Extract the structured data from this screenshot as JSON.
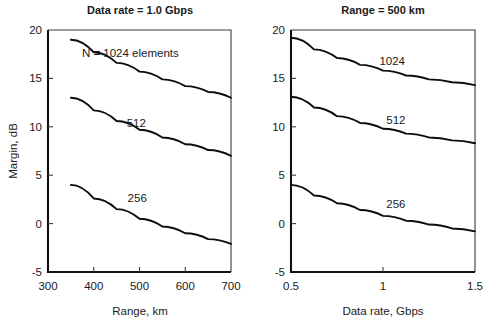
{
  "figure": {
    "width": 501,
    "height": 328,
    "background": "#ffffff",
    "ink_color": "#111111"
  },
  "chart_data": [
    {
      "type": "line",
      "panel": "left",
      "title": "Data rate = 1.0 Gbps",
      "xlabel": "Range, km",
      "ylabel": "Margin, dB",
      "xlim": [
        300,
        700
      ],
      "ylim": [
        -5,
        20
      ],
      "xticks": [
        300,
        400,
        500,
        600,
        700
      ],
      "xtick_labels": [
        "300",
        "400",
        "500",
        "600",
        "700"
      ],
      "yticks": [
        -5,
        0,
        5,
        10,
        15,
        20
      ],
      "ytick_labels": [
        "-5",
        "0",
        "5",
        "10",
        "15",
        "20"
      ],
      "grid": false,
      "legend_position": "inline-annotation",
      "series": [
        {
          "name": "N = 1024 elements",
          "label": "N = 1024 elements",
          "label_x": 480,
          "label_y": 17.6,
          "x": [
            350,
            400,
            450,
            500,
            550,
            600,
            650,
            700
          ],
          "values": [
            19.0,
            17.7,
            16.6,
            15.7,
            14.9,
            14.2,
            13.6,
            13.0
          ]
        },
        {
          "name": "512",
          "label": "512",
          "label_x": 493,
          "label_y": 10.4,
          "x": [
            350,
            400,
            450,
            500,
            550,
            600,
            650,
            700
          ],
          "values": [
            13.0,
            11.7,
            10.6,
            9.7,
            8.9,
            8.2,
            7.6,
            7.0
          ]
        },
        {
          "name": "256",
          "label": "256",
          "label_x": 495,
          "label_y": 2.6,
          "x": [
            350,
            400,
            450,
            500,
            550,
            600,
            650,
            700
          ],
          "values": [
            4.0,
            2.6,
            1.5,
            0.5,
            -0.3,
            -1.0,
            -1.6,
            -2.1
          ]
        }
      ]
    },
    {
      "type": "line",
      "panel": "right",
      "title": "Range = 500 km",
      "xlabel": "Data rate, Gbps",
      "ylabel": "Margin, dB",
      "xlim": [
        0.5,
        1.5
      ],
      "ylim": [
        -5,
        20
      ],
      "xticks": [
        0.5,
        1.0,
        1.5
      ],
      "xtick_labels": [
        "0.5",
        "1",
        "1.5"
      ],
      "yticks": [
        -5,
        0,
        5,
        10,
        15,
        20
      ],
      "ytick_labels": [
        "-5",
        "0",
        "5",
        "10",
        "15",
        "20"
      ],
      "grid": false,
      "legend_position": "inline-annotation",
      "series": [
        {
          "name": "1024",
          "label": "1024",
          "label_x": 1.05,
          "label_y": 16.8,
          "x": [
            0.5,
            0.625,
            0.75,
            0.875,
            1.0,
            1.125,
            1.25,
            1.375,
            1.5
          ],
          "values": [
            19.2,
            18.0,
            17.1,
            16.4,
            15.8,
            15.3,
            14.9,
            14.6,
            14.3
          ]
        },
        {
          "name": "512",
          "label": "512",
          "label_x": 1.07,
          "label_y": 10.7,
          "x": [
            0.5,
            0.625,
            0.75,
            0.875,
            1.0,
            1.125,
            1.25,
            1.375,
            1.5
          ],
          "values": [
            13.1,
            12.0,
            11.1,
            10.4,
            9.8,
            9.3,
            8.9,
            8.6,
            8.3
          ]
        },
        {
          "name": "256",
          "label": "256",
          "label_x": 1.07,
          "label_y": 2.0,
          "x": [
            0.5,
            0.625,
            0.75,
            0.875,
            1.0,
            1.125,
            1.25,
            1.375,
            1.5
          ],
          "values": [
            4.0,
            2.9,
            2.1,
            1.4,
            0.8,
            0.3,
            -0.1,
            -0.5,
            -0.8
          ]
        }
      ]
    }
  ]
}
